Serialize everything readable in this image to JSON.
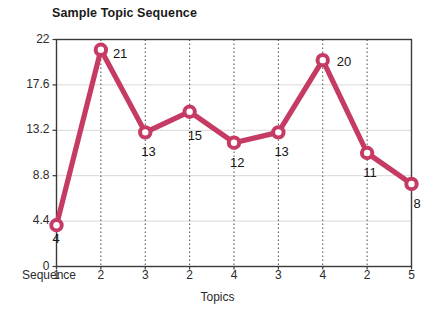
{
  "chart_data": {
    "type": "line",
    "title": "Sample Topic Sequence",
    "xlabel": "Topics",
    "ylabel": "",
    "x_axis_prefix_label": "Sequence",
    "categories": [
      "1",
      "2",
      "3",
      "2",
      "4",
      "3",
      "4",
      "2",
      "5"
    ],
    "values": [
      4,
      21,
      13,
      15,
      12,
      13,
      20,
      11,
      8
    ],
    "point_labels": [
      "4",
      "21",
      "13",
      "15",
      "12",
      "13",
      "20",
      "11",
      "8"
    ],
    "ylim": [
      0,
      22
    ],
    "yticks": [
      0,
      4.4,
      8.8,
      13.2,
      17.6,
      22
    ],
    "ytick_labels": [
      "0",
      "4.4",
      "8.8",
      "13.2",
      "17.6",
      "22"
    ],
    "xtick_labels": [
      "1",
      "2",
      "3",
      "2",
      "4",
      "3",
      "4",
      "2",
      "5"
    ],
    "series": [
      {
        "name": "Sequence",
        "values": [
          4,
          21,
          13,
          15,
          12,
          13,
          20,
          11,
          8
        ]
      }
    ],
    "grid": {
      "horizontal": "solid-light-gray",
      "vertical": "dotted-dark-gray"
    },
    "legend": "none",
    "marker": "open-circle",
    "colors": {
      "line": "#C63B63",
      "marker_fill": "#FFFFFF",
      "marker_stroke": "#C63B63",
      "axis": "#3a3a3a",
      "h_gridline": "#d8d8d8",
      "v_gridline": "#4a4a4a",
      "text": "#2b2b2b",
      "title_text": "#1a1a1a",
      "background": "#FFFFFF"
    }
  }
}
